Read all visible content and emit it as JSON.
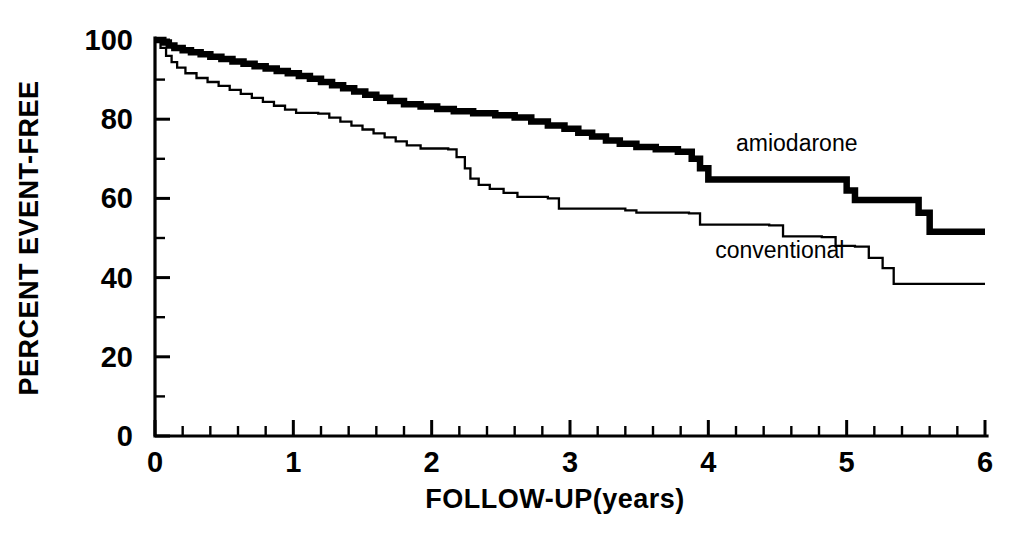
{
  "chart_data": {
    "type": "line",
    "title": "",
    "subtitle": "",
    "xlabel": "FOLLOW-UP(years)",
    "ylabel": "PERCENT EVENT-FREE",
    "xlim": [
      0,
      6
    ],
    "ylim": [
      0,
      100
    ],
    "grid": false,
    "legend_position": "inline-annotations",
    "x_ticks_major": [
      0,
      1,
      2,
      3,
      4,
      5,
      6
    ],
    "x_tick_labels": [
      "0",
      "1",
      "2",
      "3",
      "4",
      "5",
      "6"
    ],
    "x_minor_interval": 0.2,
    "y_ticks_major": [
      0,
      20,
      40,
      60,
      80,
      100
    ],
    "y_tick_labels": [
      "0",
      "20",
      "40",
      "60",
      "80",
      "100"
    ],
    "y_minor_interval": 10,
    "style": "kaplan-meier step curves",
    "annotations": [
      {
        "text": "amiodarone",
        "x": 4.2,
        "y": 72
      },
      {
        "text": "conventional",
        "x": 4.05,
        "y": 45
      }
    ],
    "series": [
      {
        "name": "amiodarone",
        "label": "amiodarone",
        "line_style": "thick",
        "color": "#000000",
        "points": [
          [
            0.0,
            100.0
          ],
          [
            0.06,
            99.4
          ],
          [
            0.1,
            98.6
          ],
          [
            0.14,
            98.0
          ],
          [
            0.2,
            97.4
          ],
          [
            0.26,
            96.9
          ],
          [
            0.33,
            96.4
          ],
          [
            0.4,
            95.8
          ],
          [
            0.48,
            95.2
          ],
          [
            0.56,
            94.6
          ],
          [
            0.64,
            94.0
          ],
          [
            0.72,
            93.4
          ],
          [
            0.8,
            92.8
          ],
          [
            0.88,
            92.2
          ],
          [
            0.96,
            91.6
          ],
          [
            1.04,
            90.9
          ],
          [
            1.12,
            90.2
          ],
          [
            1.2,
            89.4
          ],
          [
            1.28,
            88.6
          ],
          [
            1.36,
            87.8
          ],
          [
            1.44,
            87.0
          ],
          [
            1.52,
            86.2
          ],
          [
            1.6,
            85.4
          ],
          [
            1.7,
            84.6
          ],
          [
            1.8,
            83.8
          ],
          [
            1.92,
            83.2
          ],
          [
            2.04,
            82.6
          ],
          [
            2.16,
            82.0
          ],
          [
            2.3,
            81.5
          ],
          [
            2.46,
            81.0
          ],
          [
            2.6,
            80.4
          ],
          [
            2.72,
            79.4
          ],
          [
            2.84,
            78.4
          ],
          [
            2.96,
            77.6
          ],
          [
            3.06,
            76.6
          ],
          [
            3.16,
            75.6
          ],
          [
            3.26,
            74.6
          ],
          [
            3.36,
            73.8
          ],
          [
            3.48,
            73.0
          ],
          [
            3.62,
            72.4
          ],
          [
            3.78,
            71.8
          ],
          [
            3.88,
            70.0
          ],
          [
            3.94,
            67.6
          ],
          [
            4.0,
            64.8
          ],
          [
            4.94,
            64.8
          ],
          [
            5.0,
            62.0
          ],
          [
            5.06,
            59.6
          ],
          [
            5.44,
            59.6
          ],
          [
            5.52,
            56.4
          ],
          [
            5.6,
            51.6
          ],
          [
            6.0,
            51.6
          ]
        ]
      },
      {
        "name": "conventional",
        "label": "conventional",
        "line_style": "thin",
        "color": "#000000",
        "points": [
          [
            0.0,
            100.0
          ],
          [
            0.04,
            98.0
          ],
          [
            0.08,
            96.0
          ],
          [
            0.12,
            94.4
          ],
          [
            0.16,
            93.0
          ],
          [
            0.22,
            91.6
          ],
          [
            0.3,
            90.4
          ],
          [
            0.38,
            89.4
          ],
          [
            0.46,
            88.4
          ],
          [
            0.54,
            87.4
          ],
          [
            0.62,
            86.4
          ],
          [
            0.7,
            85.4
          ],
          [
            0.78,
            84.4
          ],
          [
            0.86,
            83.4
          ],
          [
            0.94,
            82.4
          ],
          [
            1.02,
            81.6
          ],
          [
            1.18,
            81.4
          ],
          [
            1.26,
            80.4
          ],
          [
            1.34,
            79.4
          ],
          [
            1.42,
            78.4
          ],
          [
            1.5,
            77.4
          ],
          [
            1.58,
            76.4
          ],
          [
            1.66,
            75.4
          ],
          [
            1.74,
            74.4
          ],
          [
            1.82,
            73.4
          ],
          [
            1.92,
            72.6
          ],
          [
            2.12,
            72.4
          ],
          [
            2.18,
            70.4
          ],
          [
            2.24,
            67.6
          ],
          [
            2.28,
            65.0
          ],
          [
            2.34,
            63.4
          ],
          [
            2.42,
            62.4
          ],
          [
            2.52,
            61.4
          ],
          [
            2.62,
            60.4
          ],
          [
            2.84,
            60.0
          ],
          [
            2.92,
            57.4
          ],
          [
            3.4,
            57.0
          ],
          [
            3.48,
            56.4
          ],
          [
            3.86,
            56.2
          ],
          [
            3.94,
            53.4
          ],
          [
            4.44,
            53.2
          ],
          [
            4.54,
            50.4
          ],
          [
            4.82,
            50.2
          ],
          [
            4.92,
            48.0
          ],
          [
            5.06,
            47.8
          ],
          [
            5.16,
            45.0
          ],
          [
            5.26,
            42.4
          ],
          [
            5.34,
            38.4
          ],
          [
            6.0,
            38.4
          ]
        ]
      }
    ]
  }
}
